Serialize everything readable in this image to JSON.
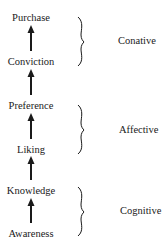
{
  "diagram": {
    "type": "hierarchy-of-effects",
    "stages": [
      {
        "label": "Purchase",
        "y": 18
      },
      {
        "label": "Conviction",
        "y": 62
      },
      {
        "label": "Preference",
        "y": 106
      },
      {
        "label": "Liking",
        "y": 150
      },
      {
        "label": "Knowledge",
        "y": 191
      },
      {
        "label": "Awareness",
        "y": 234
      }
    ],
    "groups": [
      {
        "label": "Conative",
        "y": 41
      },
      {
        "label": "Affective",
        "y": 130
      },
      {
        "label": "Cognitive",
        "y": 211
      }
    ]
  }
}
